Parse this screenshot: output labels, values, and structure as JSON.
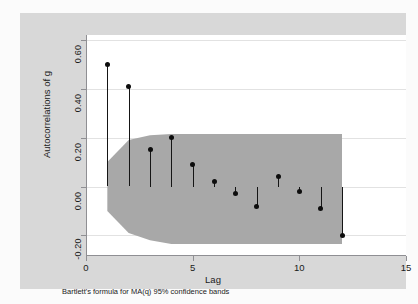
{
  "chart_data": {
    "type": "scatter",
    "title": "",
    "subtitle": "",
    "xlabel": "Lag",
    "ylabel": "Autocorrelations of g",
    "note": "Bartlett's formula for MA(q) 95% confidence bands",
    "grid": true,
    "legend": "none",
    "xlim": [
      0,
      15
    ],
    "ylim": [
      -0.28,
      0.62
    ],
    "xticks": [
      0,
      5,
      10,
      15
    ],
    "xtick_labels": [
      "0",
      "5",
      "10",
      "15"
    ],
    "yticks": [
      -0.2,
      0.0,
      0.2,
      0.4,
      0.6
    ],
    "ytick_labels": [
      "-0.20",
      "0.00",
      "0.20",
      "0.40",
      "0.60"
    ],
    "x": [
      1,
      2,
      3,
      4,
      5,
      6,
      7,
      8,
      9,
      10,
      11,
      12
    ],
    "values": [
      0.5,
      0.41,
      0.15,
      0.2,
      0.09,
      0.02,
      -0.03,
      -0.08,
      0.04,
      -0.02,
      -0.09,
      -0.2
    ],
    "series": [
      {
        "name": "Autocorrelations of g",
        "marker": "filled-circle",
        "marker_color": "#0d0d0d",
        "stem_color": "#151515",
        "values": [
          0.5,
          0.41,
          0.15,
          0.2,
          0.09,
          0.02,
          -0.03,
          -0.08,
          0.04,
          -0.02,
          -0.09,
          -0.2
        ]
      }
    ],
    "confidence_band": {
      "label": "Bartlett's formula for MA(q) 95% confidence bands",
      "level": "95%",
      "fill_color": "#a8a8a8",
      "upper": [
        0.1,
        0.19,
        0.21,
        0.215,
        0.215,
        0.215,
        0.215,
        0.215,
        0.215,
        0.215,
        0.215,
        0.215
      ],
      "lower": [
        -0.1,
        -0.19,
        -0.22,
        -0.235,
        -0.235,
        -0.235,
        -0.235,
        -0.235,
        -0.235,
        -0.235,
        -0.235,
        -0.235
      ]
    },
    "colors": {
      "graph_background": "#d8d8d8",
      "plot_background": "#ffffff",
      "gridline": "#e2e2e2",
      "axis": "#8f8f93",
      "band_fill": "#a8a8a8",
      "marker": "#0d0d0d"
    }
  }
}
